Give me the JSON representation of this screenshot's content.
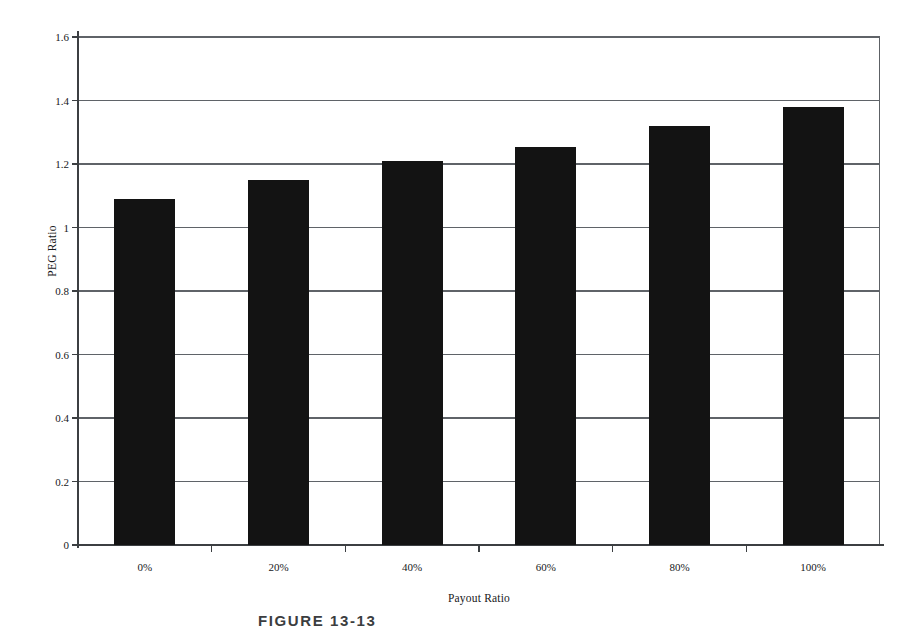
{
  "chart_data": {
    "type": "bar",
    "title": "",
    "xlabel": "Payout Ratio",
    "ylabel": "PEG Ratio",
    "categories": [
      "0%",
      "20%",
      "40%",
      "60%",
      "80%",
      "100%"
    ],
    "values": [
      1.09,
      1.15,
      1.21,
      1.255,
      1.32,
      1.38
    ],
    "ylim": [
      0,
      1.6
    ],
    "ytick_labels": [
      "0",
      "0.2",
      "0.4",
      "0.6",
      "0.8",
      "1",
      "1.2",
      "1.4",
      "1.6"
    ],
    "ytick_values": [
      0,
      0.2,
      0.4,
      0.6,
      0.8,
      1.0,
      1.2,
      1.4,
      1.6
    ],
    "grid": true,
    "grid_axis": "y",
    "legend": false,
    "legend_position": "none",
    "bar_color": "#131313",
    "series": [
      {
        "name": "PEG Ratio",
        "values": [
          1.09,
          1.15,
          1.21,
          1.255,
          1.32,
          1.38
        ]
      }
    ]
  },
  "caption": {
    "text": "FIGURE 13-13"
  }
}
